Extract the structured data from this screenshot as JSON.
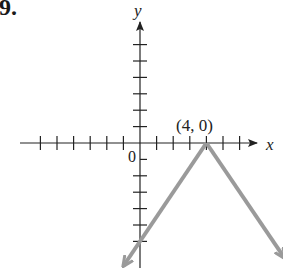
{
  "problem_number": "9.",
  "chart_data": {
    "type": "line",
    "title": "",
    "xlabel": "x",
    "ylabel": "y",
    "origin_label": "0",
    "xlim": [
      -6,
      6
    ],
    "ylim": [
      -6,
      6
    ],
    "x_ticks": [
      -6,
      -5,
      -4,
      -3,
      -2,
      -1,
      1,
      2,
      3,
      4,
      5,
      6
    ],
    "y_ticks": [
      -6,
      -5,
      -4,
      -3,
      -2,
      -1,
      1,
      2,
      3,
      4,
      5,
      6
    ],
    "grid": false,
    "series": [
      {
        "name": "f(x) = -1.5|x - 4|",
        "color": "#9a9a9a",
        "x": [
          -1,
          4,
          8.7
        ],
        "y": [
          -7.5,
          0,
          -7
        ]
      }
    ],
    "annotations": [
      {
        "text": "(4, 0)",
        "x": 4,
        "y": 0
      }
    ],
    "arrows": [
      "both ends of graph",
      "positive x-axis",
      "positive y-axis"
    ]
  }
}
